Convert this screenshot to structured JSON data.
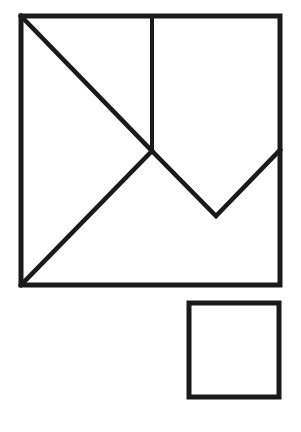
{
  "diagram": {
    "title": "",
    "stroke_color": "#1a1a1a",
    "background_color": "#ffffff",
    "pieces": [
      {
        "name": "top-left-triangle",
        "kind": "triangle"
      },
      {
        "name": "left-triangle",
        "kind": "triangle"
      },
      {
        "name": "top-right-pentagon",
        "kind": "pentagon"
      },
      {
        "name": "bottom-region",
        "kind": "polygon"
      }
    ],
    "shapes": [
      {
        "name": "large-square",
        "kind": "square"
      },
      {
        "name": "small-square",
        "kind": "square"
      }
    ],
    "labels": []
  }
}
